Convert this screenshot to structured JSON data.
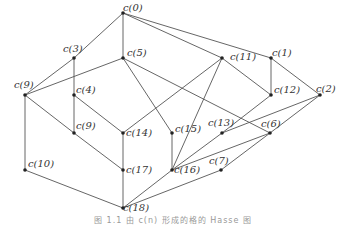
{
  "diagram": {
    "type": "hasse-diagram",
    "nodes": [
      {
        "id": "n0",
        "label": "c(0)",
        "x": 123,
        "y": 13,
        "lx": 123,
        "ly": 3
      },
      {
        "id": "n1",
        "label": "c(1)",
        "x": 271,
        "y": 58,
        "lx": 272,
        "ly": 48
      },
      {
        "id": "n2",
        "label": "c(2)",
        "x": 320,
        "y": 95,
        "lx": 316,
        "ly": 84
      },
      {
        "id": "n3",
        "label": "c(3)",
        "x": 74,
        "y": 58,
        "lx": 63,
        "ly": 44
      },
      {
        "id": "n4",
        "label": "c(4)",
        "x": 74,
        "y": 95,
        "lx": 76,
        "ly": 85
      },
      {
        "id": "n5",
        "label": "c(5)",
        "x": 123,
        "y": 58,
        "lx": 127,
        "ly": 48
      },
      {
        "id": "n6",
        "label": "c(6)",
        "x": 270,
        "y": 133,
        "lx": 261,
        "ly": 119
      },
      {
        "id": "n7",
        "label": "c(7)",
        "x": 221,
        "y": 170,
        "lx": 209,
        "ly": 156
      },
      {
        "id": "n9a",
        "label": "c(9)",
        "x": 25,
        "y": 95,
        "lx": 14,
        "ly": 80
      },
      {
        "id": "n9b",
        "label": "c(9)",
        "x": 74,
        "y": 133,
        "lx": 76,
        "ly": 121
      },
      {
        "id": "n10",
        "label": "c(10)",
        "x": 25,
        "y": 170,
        "lx": 28,
        "ly": 159
      },
      {
        "id": "n11",
        "label": "c(11)",
        "x": 222,
        "y": 58,
        "lx": 230,
        "ly": 52
      },
      {
        "id": "n12",
        "label": "c(12)",
        "x": 271,
        "y": 95,
        "lx": 274,
        "ly": 85
      },
      {
        "id": "n13",
        "label": "c(13)",
        "x": 222,
        "y": 133,
        "lx": 208,
        "ly": 118
      },
      {
        "id": "n14",
        "label": "c(14)",
        "x": 123,
        "y": 133,
        "lx": 126,
        "ly": 128
      },
      {
        "id": "n15",
        "label": "c(15)",
        "x": 172,
        "y": 133,
        "lx": 175,
        "ly": 124
      },
      {
        "id": "n16",
        "label": "c(16)",
        "x": 172,
        "y": 170,
        "lx": 174,
        "ly": 165
      },
      {
        "id": "n17",
        "label": "c(17)",
        "x": 123,
        "y": 170,
        "lx": 126,
        "ly": 165
      },
      {
        "id": "n18",
        "label": "c(18)",
        "x": 123,
        "y": 208,
        "lx": 123,
        "ly": 203
      }
    ],
    "edges": [
      [
        "n0",
        "n3"
      ],
      [
        "n0",
        "n5"
      ],
      [
        "n0",
        "n1"
      ],
      [
        "n0",
        "n11"
      ],
      [
        "n3",
        "n9a"
      ],
      [
        "n3",
        "n4"
      ],
      [
        "n5",
        "n9a"
      ],
      [
        "n5",
        "n15"
      ],
      [
        "n5",
        "n6"
      ],
      [
        "n9a",
        "n10"
      ],
      [
        "n9a",
        "n9b"
      ],
      [
        "n4",
        "n9b"
      ],
      [
        "n4",
        "n14"
      ],
      [
        "n9b",
        "n17"
      ],
      [
        "n11",
        "n14"
      ],
      [
        "n11",
        "n16"
      ],
      [
        "n11",
        "n12"
      ],
      [
        "n1",
        "n12"
      ],
      [
        "n1",
        "n2"
      ],
      [
        "n12",
        "n13"
      ],
      [
        "n13",
        "n16"
      ],
      [
        "n2",
        "n13"
      ],
      [
        "n2",
        "n6"
      ],
      [
        "n6",
        "n16"
      ],
      [
        "n6",
        "n7"
      ],
      [
        "n7",
        "n18"
      ],
      [
        "n16",
        "n18"
      ],
      [
        "n15",
        "n16"
      ],
      [
        "n14",
        "n17"
      ],
      [
        "n17",
        "n18"
      ],
      [
        "n10",
        "n18"
      ]
    ]
  },
  "caption": "图 1.1  由 c(n) 形成的格的 Hasse 图"
}
